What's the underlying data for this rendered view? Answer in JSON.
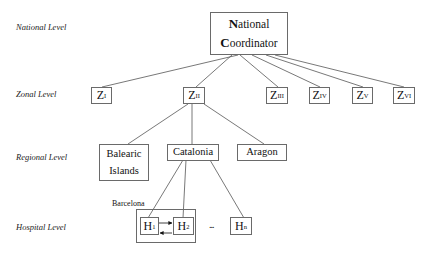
{
  "levels": {
    "national": "National Level",
    "zonal": "Zonal Level",
    "regional": "Regional Level",
    "hospital": "Hospital Level"
  },
  "national_coordinator": {
    "line1_initial": "N",
    "line1_rest": "ational",
    "line2_initial": "C",
    "line2_rest": "oordinator"
  },
  "zones": [
    {
      "id": "ZI",
      "letter": "Z",
      "sub": "I"
    },
    {
      "id": "ZII",
      "letter": "Z",
      "sub": "II"
    },
    {
      "id": "ZIII",
      "letter": "Z",
      "sub": "III"
    },
    {
      "id": "ZIV",
      "letter": "Z",
      "sub": "IV"
    },
    {
      "id": "ZV",
      "letter": "Z",
      "sub": "V"
    },
    {
      "id": "ZVI",
      "letter": "Z",
      "sub": "VI"
    }
  ],
  "regions": [
    {
      "id": "balearic",
      "line1": "Balearic",
      "line2": "Islands"
    },
    {
      "id": "catalonia",
      "line1": "Catalonia"
    },
    {
      "id": "aragon",
      "line1": "Aragon"
    }
  ],
  "hospital_group": {
    "label": "Barcelona"
  },
  "hospitals": [
    {
      "id": "H1",
      "letter": "H",
      "sub": "1"
    },
    {
      "id": "H2",
      "letter": "H",
      "sub": "2"
    },
    {
      "id": "Hn",
      "letter": "H",
      "sub": "n"
    }
  ],
  "ellipsis": "...",
  "colors": {
    "border": "#6a6a6a",
    "line": "#555555",
    "text": "#111111"
  }
}
